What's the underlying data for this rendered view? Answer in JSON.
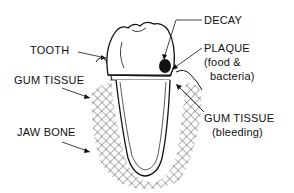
{
  "diagram": {
    "labels": {
      "tooth": "TOOTH",
      "gum_tissue": "GUM TISSUE",
      "jaw_bone": "JAW BONE",
      "decay": "DECAY",
      "plaque": "PLAQUE",
      "plaque_detail_1": "(food &",
      "plaque_detail_2": "bacteria)",
      "gum_tissue_bleeding": "GUM TISSUE",
      "gum_tissue_bleeding_detail": "(bleeding)"
    },
    "colors": {
      "line": "#111111",
      "background": "#ffffff"
    }
  }
}
